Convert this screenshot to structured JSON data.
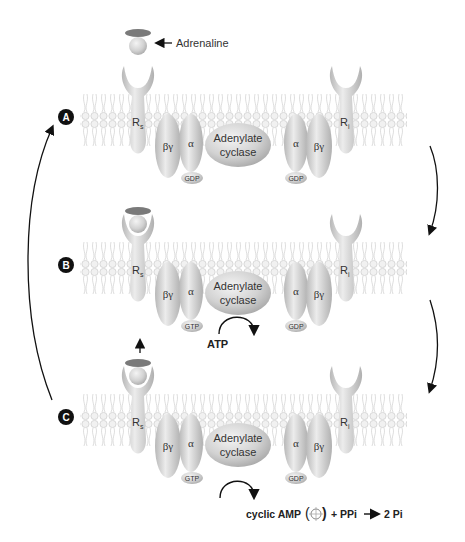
{
  "ligand": {
    "label": "Adrenaline"
  },
  "panels": [
    {
      "step_label": "A",
      "rs_label": "R",
      "rs_sub": "s",
      "ri_label": "R",
      "ri_sub": "i",
      "left_g": {
        "beta_gamma": "βγ",
        "alpha": "α",
        "nucleotide": "GDP"
      },
      "enzyme": {
        "line1": "Adenylate",
        "line2": "cyclase"
      },
      "right_g": {
        "alpha": "α",
        "beta_gamma": "βγ",
        "nucleotide": "GDP"
      }
    },
    {
      "step_label": "B",
      "rs_label": "R",
      "rs_sub": "s",
      "ri_label": "R",
      "ri_sub": "i",
      "left_g": {
        "beta_gamma": "βγ",
        "alpha": "α",
        "nucleotide": "GTP"
      },
      "enzyme": {
        "line1": "Adenylate",
        "line2": "cyclase"
      },
      "right_g": {
        "alpha": "α",
        "beta_gamma": "βγ",
        "nucleotide": "GDP"
      },
      "substrate": "ATP"
    },
    {
      "step_label": "C",
      "rs_label": "R",
      "rs_sub": "s",
      "ri_label": "R",
      "ri_sub": "i",
      "left_g": {
        "beta_gamma": "βγ",
        "alpha": "α",
        "nucleotide": "GTP"
      },
      "enzyme": {
        "line1": "Adenylate",
        "line2": "cyclase"
      },
      "right_g": {
        "alpha": "α",
        "beta_gamma": "βγ",
        "nucleotide": "GDP"
      },
      "products": {
        "cyclic_amp": "cyclic AMP",
        "paren_open": "(",
        "paren_close": ")",
        "plus_ppi": "+ PPi",
        "result": "2 Pi"
      }
    }
  ],
  "colors": {
    "protein": "#cfcfcf",
    "protein_dark": "#9a9a9a",
    "membrane": "#d8d8d8",
    "label_circle": "#111111",
    "arrow": "#111111"
  }
}
